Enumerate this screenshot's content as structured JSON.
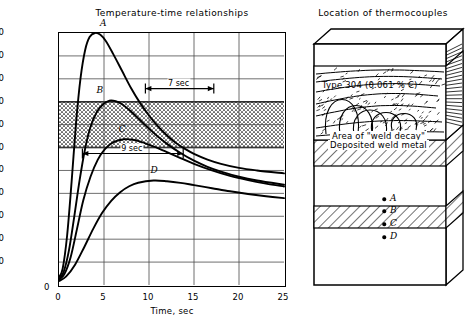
{
  "chart_data": {
    "type": "line",
    "title": "Temperature-time relationships",
    "xlabel": "Time, sec",
    "ylabel": "Temperature, °F",
    "xlim": [
      0,
      25
    ],
    "ylim": [
      0,
      2200
    ],
    "xticks": [
      0,
      5,
      10,
      15,
      20,
      25
    ],
    "yticks": [
      0,
      200,
      400,
      600,
      800,
      1000,
      1200,
      1400,
      1600,
      1800,
      2000,
      2200
    ],
    "grid": true,
    "legend": "none",
    "sensitization_band": {
      "label": "sensitization temperature range",
      "ymin": 1200,
      "ymax": 1600,
      "fill": "stipple"
    },
    "series": [
      {
        "name": "A",
        "label": "A",
        "peak_time": 4.0,
        "peak_temp": 2200,
        "points": [
          [
            0,
            70
          ],
          [
            0.4,
            140
          ],
          [
            0.9,
            430
          ],
          [
            1.4,
            900
          ],
          [
            1.9,
            1420
          ],
          [
            2.4,
            1810
          ],
          [
            2.9,
            2050
          ],
          [
            3.4,
            2165
          ],
          [
            4.0,
            2200
          ],
          [
            4.6,
            2185
          ],
          [
            5.2,
            2130
          ],
          [
            6.0,
            2020
          ],
          [
            7.0,
            1870
          ],
          [
            8.0,
            1720
          ],
          [
            9.0,
            1590
          ],
          [
            10.0,
            1480
          ],
          [
            11.0,
            1385
          ],
          [
            12.0,
            1305
          ],
          [
            13.0,
            1240
          ],
          [
            14.0,
            1188
          ],
          [
            15.0,
            1145
          ],
          [
            16.5,
            1095
          ],
          [
            18.0,
            1058
          ],
          [
            20.0,
            1022
          ],
          [
            22.0,
            1000
          ],
          [
            25.0,
            975
          ]
        ]
      },
      {
        "name": "B",
        "label": "B",
        "peak_time": 5.6,
        "peak_temp": 1610,
        "points": [
          [
            0,
            55
          ],
          [
            0.5,
            110
          ],
          [
            1.1,
            300
          ],
          [
            1.7,
            600
          ],
          [
            2.3,
            920
          ],
          [
            2.9,
            1190
          ],
          [
            3.5,
            1380
          ],
          [
            4.2,
            1510
          ],
          [
            4.9,
            1578
          ],
          [
            5.6,
            1610
          ],
          [
            6.3,
            1605
          ],
          [
            7.0,
            1578
          ],
          [
            8.0,
            1515
          ],
          [
            9.0,
            1440
          ],
          [
            10.0,
            1365
          ],
          [
            11.0,
            1295
          ],
          [
            12.0,
            1232
          ],
          [
            13.5,
            1152
          ],
          [
            15.0,
            1085
          ],
          [
            16.5,
            1032
          ],
          [
            18.0,
            990
          ],
          [
            20.0,
            945
          ],
          [
            22.0,
            912
          ],
          [
            25.0,
            875
          ]
        ]
      },
      {
        "name": "C",
        "label": "C",
        "peak_time": 7.2,
        "peak_temp": 1272,
        "points": [
          [
            0,
            45
          ],
          [
            0.6,
            95
          ],
          [
            1.3,
            245
          ],
          [
            2.0,
            490
          ],
          [
            2.7,
            740
          ],
          [
            3.5,
            945
          ],
          [
            4.3,
            1092
          ],
          [
            5.1,
            1186
          ],
          [
            6.0,
            1245
          ],
          [
            7.2,
            1272
          ],
          [
            8.2,
            1268
          ],
          [
            9.2,
            1248
          ],
          [
            10.5,
            1210
          ],
          [
            12.0,
            1160
          ],
          [
            13.5,
            1108
          ],
          [
            15.0,
            1058
          ],
          [
            17.0,
            1000
          ],
          [
            19.0,
            952
          ],
          [
            21.0,
            915
          ],
          [
            23.0,
            885
          ],
          [
            25.0,
            860
          ]
        ]
      },
      {
        "name": "D",
        "label": "D",
        "peak_time": 10.5,
        "peak_temp": 912,
        "points": [
          [
            0,
            35
          ],
          [
            0.8,
            75
          ],
          [
            1.8,
            180
          ],
          [
            2.8,
            330
          ],
          [
            3.8,
            490
          ],
          [
            4.8,
            630
          ],
          [
            5.8,
            735
          ],
          [
            6.8,
            810
          ],
          [
            7.8,
            862
          ],
          [
            8.8,
            893
          ],
          [
            10.5,
            912
          ],
          [
            12.0,
            906
          ],
          [
            13.5,
            892
          ],
          [
            15.0,
            872
          ],
          [
            17.0,
            845
          ],
          [
            19.0,
            818
          ],
          [
            21.0,
            795
          ],
          [
            23.0,
            775
          ],
          [
            25.0,
            758
          ]
        ]
      }
    ],
    "annotations": [
      {
        "text": "7 sec",
        "type": "dimension-arrow",
        "y_temp": 1715,
        "x_from": 9.6,
        "x_to": 17.2
      },
      {
        "text": "9 sec",
        "type": "dimension-arrow",
        "y_temp": 1148,
        "x_from": 2.6,
        "x_to": 13.8
      }
    ]
  },
  "chart": {
    "title": "Temperature-time relationships",
    "xlabel": "Time, sec",
    "ylabel": "Temperature, °F",
    "xticks": [
      "0",
      "5",
      "10",
      "15",
      "20",
      "25"
    ],
    "yticks": [
      "2200",
      "2000",
      "1800",
      "1600",
      "1400",
      "1200",
      "1000",
      "800",
      "600",
      "400",
      "200",
      "0"
    ],
    "curve_labels": [
      "A",
      "B",
      "C",
      "D"
    ],
    "annotation_7sec": "7 sec",
    "annotation_9sec": "9 sec"
  },
  "diagram": {
    "title": "Location of thermocouples",
    "material": "Type 304 (0.061 % C)",
    "weld_decay": "Area of \"weld decay\"",
    "weld_metal": "Deposited weld metal",
    "thermocouples": [
      {
        "label": "A",
        "depth_px": 199
      },
      {
        "label": "B",
        "depth_px": 211
      },
      {
        "label": "C",
        "depth_px": 224
      },
      {
        "label": "D",
        "depth_px": 237
      }
    ]
  },
  "colors": {
    "ink": "#000000",
    "paper": "#ffffff",
    "grid": "#555555",
    "band": "#000000"
  }
}
